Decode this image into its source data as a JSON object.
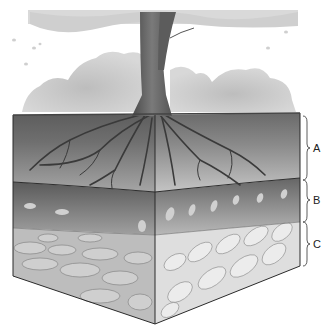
{
  "figure": {
    "horizons": [
      {
        "label": "A",
        "name": "topsoil"
      },
      {
        "label": "B",
        "name": "subsoil"
      },
      {
        "label": "C",
        "name": "weathered parent rock"
      }
    ],
    "colors": {
      "background": "#ffffff",
      "foliage": "#c8c8c8",
      "trunk": "#6a6a6a",
      "horizon_a": "#7a7a7a",
      "horizon_b": "#8c8c8c",
      "horizon_c": "#d8d8d8",
      "line": "#333333"
    }
  }
}
